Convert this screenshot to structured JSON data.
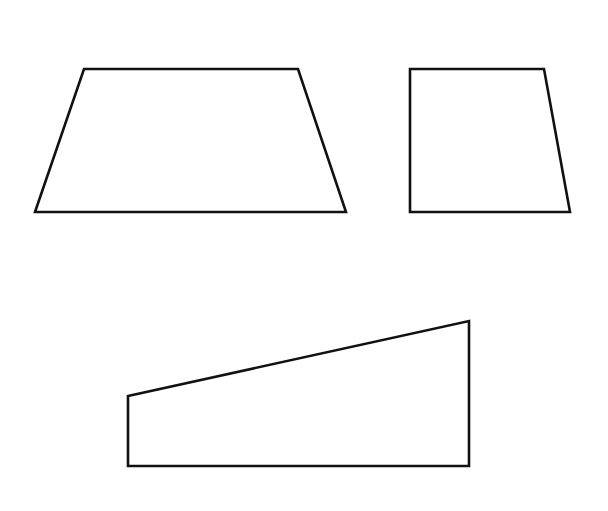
{
  "diagram": {
    "stroke_color": "#111111",
    "background_color": "#ffffff",
    "shapes": [
      {
        "id": "isosceles-trapezoid",
        "kind": "trapezoid",
        "sides": 4
      },
      {
        "id": "right-trapezoid-upright",
        "kind": "right trapezoid",
        "sides": 4
      },
      {
        "id": "right-trapezoid-wedge",
        "kind": "right trapezoid",
        "sides": 4
      }
    ]
  }
}
